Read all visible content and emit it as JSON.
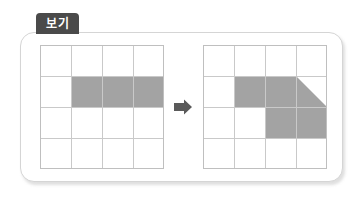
{
  "label": {
    "tab_text": "보기"
  },
  "colors": {
    "tab_background": "#4a4a4a",
    "tab_text": "#ffffff",
    "panel_border": "#d5d5d5",
    "panel_background": "#ffffff",
    "grid_line": "#c9c9c9",
    "grid_border": "#bfbfbf",
    "shape_fill": "#a3a3a3",
    "arrow_fill": "#5a5a5a"
  },
  "diagram": {
    "title": "보기",
    "type": "grid-shape-transformation",
    "arrow_direction": "right",
    "grids": [
      {
        "name": "before-grid",
        "rows": 4,
        "cols": 4,
        "shape_name": "horizontal-rectangle",
        "shape_description": "Gray rectangle covering row 2, columns 2 through 4",
        "filled_cells": [
          {
            "row": 2,
            "col": 2
          },
          {
            "row": 2,
            "col": 3
          },
          {
            "row": 2,
            "col": 4
          }
        ],
        "polygon_points": "1,1 4,1 4,2 1,2"
      },
      {
        "name": "after-grid",
        "rows": 4,
        "cols": 4,
        "shape_name": "rotated-L-with-diagonal",
        "shape_description": "Gray polygon: square at row 2 column 2, diagonal from top of row 2 column 3 descending to right edge of row 3 column 4, plus block spanning rows 3-4 of columns 3-4",
        "filled_cells": [
          {
            "row": 2,
            "col": 2
          },
          {
            "row": 2,
            "col": 3
          },
          {
            "row": 3,
            "col": 3
          },
          {
            "row": 3,
            "col": 4
          },
          {
            "row": 4,
            "col": 3
          }
        ],
        "polygon_points": "1,1 3,1 4,2 4,3 2,3 2,2 1,2"
      }
    ]
  }
}
